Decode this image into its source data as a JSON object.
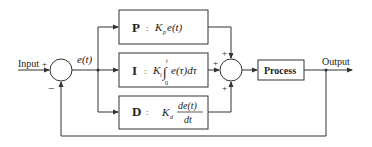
{
  "diagram": {
    "type": "PID controller block diagram",
    "input_label": "Input",
    "input_sign": "+",
    "feedback_sign": "−",
    "error_label": "e(t)",
    "output_label": "Output",
    "process_label": "Process",
    "blocks": [
      {
        "letter": "P",
        "sep": ":",
        "gain": "K",
        "gain_sub": "p",
        "expr": "e(t)"
      },
      {
        "letter": "I",
        "sep": ":",
        "gain": "K",
        "gain_sub": "i",
        "int_upper": "t",
        "int_lower": "0",
        "integrand": "e(τ)dτ"
      },
      {
        "letter": "D",
        "sep": ":",
        "gain": "K",
        "gain_sub": "d",
        "numerator": "de(t)",
        "denominator": "dt"
      }
    ],
    "sum_signs": [
      "+",
      "+",
      "+"
    ],
    "colors": {
      "line": "#333333",
      "background": "#ffffff"
    }
  }
}
